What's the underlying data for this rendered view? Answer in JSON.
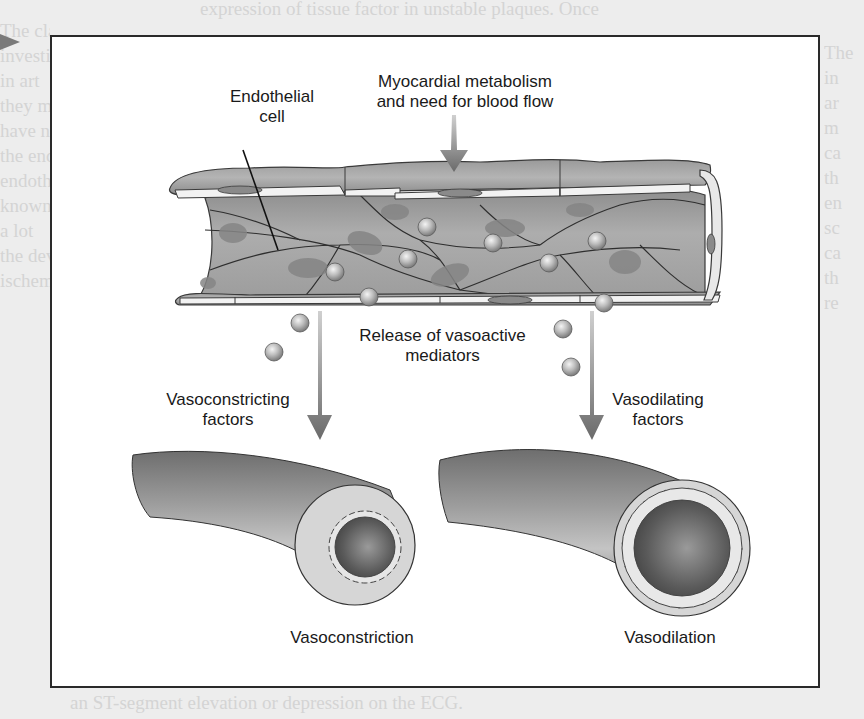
{
  "figure": {
    "labels": {
      "endothelial_cell": [
        "Endothelial",
        "cell"
      ],
      "myocardial": [
        "Myocardial metabolism",
        "and need for blood flow"
      ],
      "release": [
        "Release of vasoactive",
        "mediators"
      ],
      "vasoconstricting": [
        "Vasoconstricting",
        "factors"
      ],
      "vasodilating": [
        "Vasodilating",
        "factors"
      ],
      "vasoconstriction": "Vasoconstriction",
      "vasodilation": "Vasodilation"
    },
    "colors": {
      "vessel_outer": "#8d8d8d",
      "vessel_inner": "#a9a9a9",
      "cell_border": "#3a3a3a",
      "nucleus": "#7e7e7e",
      "mediator_sphere": "#b8b8b8",
      "arrow": "#707070",
      "frame_border": "#2a2a2a",
      "page_background": "#ededed"
    }
  },
  "page": {
    "background_text_left": [
      "The classic",
      "investigation",
      "in art",
      "they may be",
      "have not",
      "the endothe",
      "endothelial",
      "known inf",
      "a lot",
      "the dev",
      "ischemic"
    ],
    "background_text_right": [
      "The",
      "in",
      "ar",
      "m",
      "ca",
      "th",
      "en",
      "sc",
      "ca",
      "th",
      "re"
    ],
    "background_text_top": "expression of tissue factor in unstable plaques. Once",
    "background_text_bottom": "an ST-segment elevation or depression on the ECG."
  }
}
